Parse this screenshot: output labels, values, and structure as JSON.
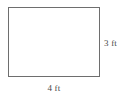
{
  "figure": {
    "shape_name": "rectangle",
    "unit": "ft",
    "height_label": "3 ft",
    "width_label": "4 ft",
    "stroke_color": "#6e6e6e",
    "fill_color": "#ffffff",
    "text_color": "#4a4a4a",
    "background_color": "#ffffff"
  },
  "chart_data": {
    "type": "diagram",
    "title": "",
    "shape": "rectangle",
    "dimensions": [
      {
        "name": "width",
        "value": 4,
        "unit": "ft",
        "label": "4 ft",
        "position": "bottom"
      },
      {
        "name": "height",
        "value": 3,
        "unit": "ft",
        "label": "3 ft",
        "position": "right"
      }
    ]
  }
}
